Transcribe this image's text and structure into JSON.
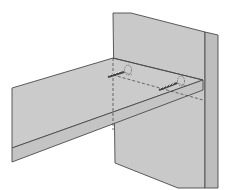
{
  "diagram": {
    "title": "",
    "colors": {
      "background": "#ffffff",
      "panel_fill": "#c9c9c9",
      "panel_edge_fill": "#bdbdbd",
      "shelf_fill": "#cbcbcb",
      "stroke": "#4a4a4a",
      "screw": "#555555"
    },
    "parts": [
      {
        "name": "vertical-panel",
        "label": ""
      },
      {
        "name": "panel-side-edge",
        "label": ""
      },
      {
        "name": "shelf-board",
        "label": ""
      },
      {
        "name": "shelf-front-edge",
        "label": ""
      },
      {
        "name": "screw-upper",
        "label": ""
      },
      {
        "name": "screw-lower",
        "label": ""
      }
    ]
  }
}
